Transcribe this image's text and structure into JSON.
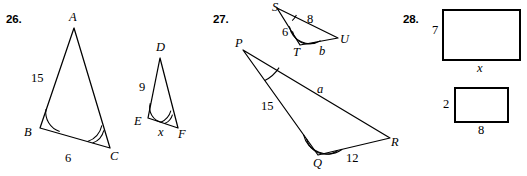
{
  "worksheet": {
    "problems": [
      {
        "number": "26.",
        "figures": [
          {
            "name": "triangle-abc",
            "vertices": [
              {
                "label": "A",
                "x": 74,
                "y": 28
              },
              {
                "label": "B",
                "x": 40,
                "y": 128
              },
              {
                "label": "C",
                "x": 110,
                "y": 148
              }
            ],
            "side_labels": [
              {
                "text": "15",
                "x": 38,
                "y": 78
              },
              {
                "text": "6",
                "x": 68,
                "y": 160
              }
            ],
            "angle_marks": [
              {
                "vertex": "B",
                "arcs": 1
              },
              {
                "vertex": "C",
                "arcs": 2
              }
            ]
          },
          {
            "name": "triangle-def",
            "vertices": [
              {
                "label": "D",
                "x": 160,
                "y": 58
              },
              {
                "label": "E",
                "x": 148,
                "y": 118
              },
              {
                "label": "F",
                "x": 178,
                "y": 128
              }
            ],
            "side_labels": [
              {
                "text": "9",
                "x": 143,
                "y": 88
              },
              {
                "text": "x",
                "x": 161,
                "y": 133
              }
            ],
            "angle_marks": [
              {
                "vertex": "E",
                "arcs": 1
              },
              {
                "vertex": "F",
                "arcs": 2
              }
            ]
          }
        ]
      },
      {
        "number": "27.",
        "figures": [
          {
            "name": "triangle-stu",
            "vertices": [
              {
                "label": "S",
                "x": 277,
                "y": 8
              },
              {
                "label": "T",
                "x": 300,
                "y": 45
              },
              {
                "label": "U",
                "x": 338,
                "y": 38
              }
            ],
            "side_labels": [
              {
                "text": "8",
                "x": 310,
                "y": 20
              },
              {
                "text": "6",
                "x": 285,
                "y": 32
              },
              {
                "text": "b",
                "x": 321,
                "y": 52
              }
            ],
            "angle_marks": [
              {
                "vertex": "S",
                "arcs": 1
              },
              {
                "vertex": "T",
                "arcs": 2
              }
            ]
          },
          {
            "name": "triangle-pqr",
            "vertices": [
              {
                "label": "P",
                "x": 243,
                "y": 50
              },
              {
                "label": "Q",
                "x": 318,
                "y": 155
              },
              {
                "label": "R",
                "x": 390,
                "y": 138
              }
            ],
            "side_labels": [
              {
                "text": "15",
                "x": 267,
                "y": 107
              },
              {
                "text": "a",
                "x": 320,
                "y": 90
              },
              {
                "text": "12",
                "x": 351,
                "y": 158
              }
            ],
            "angle_marks": [
              {
                "vertex": "P",
                "arcs": 1
              },
              {
                "vertex": "Q",
                "arcs": 2
              }
            ]
          }
        ]
      },
      {
        "number": "28.",
        "figures": [
          {
            "name": "rectangle-large",
            "x": 443,
            "y": 10,
            "width": 77,
            "height": 50,
            "side_labels": [
              {
                "text": "7",
                "x": 434,
                "y": 30,
                "role": "height"
              },
              {
                "text": "x",
                "x": 479,
                "y": 68,
                "role": "width"
              }
            ]
          },
          {
            "name": "rectangle-small",
            "x": 455,
            "y": 88,
            "width": 53,
            "height": 34,
            "side_labels": [
              {
                "text": "2",
                "x": 446,
                "y": 103,
                "role": "height"
              },
              {
                "text": "8",
                "x": 480,
                "y": 131,
                "role": "width"
              }
            ]
          }
        ]
      }
    ]
  },
  "labels": {
    "p26": {
      "number": "26.",
      "A": "A",
      "B": "B",
      "C": "C",
      "D": "D",
      "E": "E",
      "F": "F",
      "AB": "15",
      "BC": "6",
      "DE": "9",
      "EF": "x"
    },
    "p27": {
      "number": "27.",
      "S": "S",
      "T": "T",
      "U": "U",
      "P": "P",
      "Q": "Q",
      "R": "R",
      "SU": "8",
      "ST": "6",
      "TU": "b",
      "PQ": "15",
      "PR": "a",
      "QR": "12"
    },
    "p28": {
      "number": "28.",
      "large_height": "7",
      "large_width": "x",
      "small_height": "2",
      "small_width": "8"
    }
  },
  "colors": {
    "ink": "#000000",
    "paper": "#ffffff"
  }
}
